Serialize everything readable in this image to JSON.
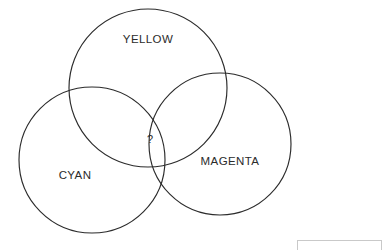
{
  "diagram": {
    "type": "venn",
    "title": "",
    "background_color": "#ffffff",
    "stroke_color": "#2b2b2b",
    "sets": [
      {
        "id": "yellow",
        "label": "YELLOW",
        "cx": 148,
        "cy": 88,
        "r": 79,
        "label_x": 148,
        "label_y": 40
      },
      {
        "id": "cyan",
        "label": "CYAN",
        "cx": 92,
        "cy": 160,
        "r": 73,
        "label_x": 75,
        "label_y": 176
      },
      {
        "id": "magenta",
        "label": "MAGENTA",
        "cx": 220,
        "cy": 144,
        "r": 71,
        "label_x": 230,
        "label_y": 162
      }
    ],
    "center_region": {
      "label": "?",
      "x": 150,
      "y": 140
    }
  },
  "bottom_strip": {
    "border_color": "#c9c9c9",
    "x": 297,
    "y": 240,
    "width": 85,
    "height": 10
  }
}
